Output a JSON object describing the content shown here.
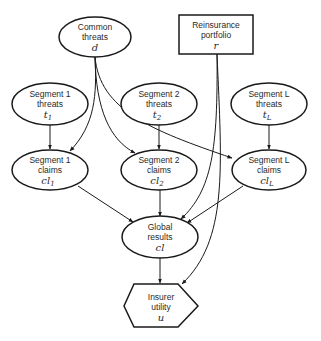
{
  "diagram": {
    "type": "influence-diagram",
    "nodes": [
      {
        "id": "d",
        "shape": "ellipse",
        "line1": "Common",
        "line2": "threats",
        "var": "d",
        "sub": ""
      },
      {
        "id": "r",
        "shape": "rectangle",
        "line1": "Reinsurance",
        "line2": "portfolio",
        "var": "r",
        "sub": ""
      },
      {
        "id": "t1",
        "shape": "ellipse",
        "line1": "Segment 1",
        "line2": "threats",
        "var": "t",
        "sub": "1"
      },
      {
        "id": "t2",
        "shape": "ellipse",
        "line1": "Segment 2",
        "line2": "threats",
        "var": "t",
        "sub": "2"
      },
      {
        "id": "tL",
        "shape": "ellipse",
        "line1": "Segment L",
        "line2": "threats",
        "var": "t",
        "sub": "L"
      },
      {
        "id": "cl1",
        "shape": "ellipse",
        "line1": "Segment 1",
        "line2": "claims",
        "var": "cl",
        "sub": "1"
      },
      {
        "id": "cl2",
        "shape": "ellipse",
        "line1": "Segment 2",
        "line2": "claims",
        "var": "cl",
        "sub": "2"
      },
      {
        "id": "clL",
        "shape": "ellipse",
        "line1": "Segment L",
        "line2": "claims",
        "var": "cl",
        "sub": "L"
      },
      {
        "id": "cl",
        "shape": "ellipse",
        "line1": "Global",
        "line2": "results",
        "var": "cl",
        "sub": ""
      },
      {
        "id": "u",
        "shape": "hexagon",
        "line1": "Insurer",
        "line2": "utility",
        "var": "u",
        "sub": ""
      }
    ],
    "edges": [
      {
        "from": "d",
        "to": "cl1"
      },
      {
        "from": "d",
        "to": "cl2"
      },
      {
        "from": "d",
        "to": "clL"
      },
      {
        "from": "t1",
        "to": "cl1"
      },
      {
        "from": "t2",
        "to": "cl2"
      },
      {
        "from": "tL",
        "to": "clL"
      },
      {
        "from": "cl1",
        "to": "cl"
      },
      {
        "from": "cl2",
        "to": "cl"
      },
      {
        "from": "clL",
        "to": "cl"
      },
      {
        "from": "r",
        "to": "cl"
      },
      {
        "from": "r",
        "to": "u"
      },
      {
        "from": "cl",
        "to": "u"
      }
    ]
  }
}
